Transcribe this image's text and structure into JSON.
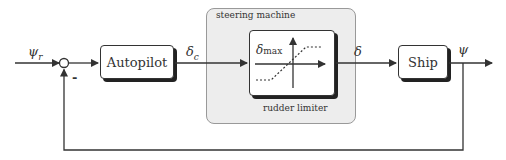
{
  "diagram": {
    "type": "block-diagram",
    "blocks": {
      "autopilot": "Autopilot",
      "ship": "Ship",
      "steering_group": "steering machine",
      "limiter_caption": "rudder limiter",
      "limiter_inner_label": "δmax"
    },
    "signals": {
      "reference": "ψr",
      "commanded_rudder": "δc",
      "rudder": "δ",
      "heading": "ψ"
    },
    "summing_junction": {
      "feedback_sign": "-"
    }
  }
}
